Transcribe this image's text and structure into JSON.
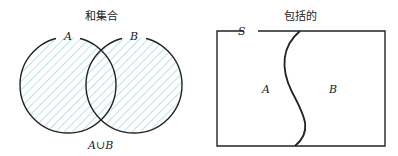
{
  "union_diagram": {
    "title": "和集合",
    "label_a": "A",
    "label_b": "B",
    "caption": "A∪B",
    "hatch_color": "#9fd8dd",
    "stroke_color": "#222222"
  },
  "inclusive_diagram": {
    "title": "包括的",
    "label_s": "S",
    "label_a": "A",
    "label_b": "B",
    "stroke_color": "#222222"
  }
}
